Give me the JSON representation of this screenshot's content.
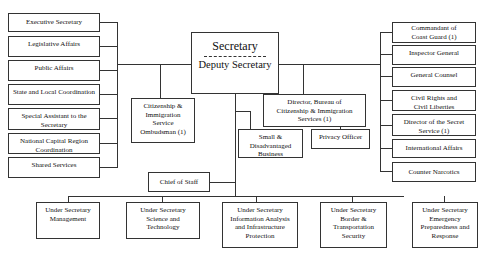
{
  "chart": {
    "center": {
      "top_label": "Secretary",
      "bottom_label": "Deputy Secretary"
    },
    "left_column": [
      {
        "label": "Executive Secretary"
      },
      {
        "label": "Legislative Affairs"
      },
      {
        "label": "Public Affairs"
      },
      {
        "label": "State and Local Coordination"
      },
      {
        "label": "Special Assistant to the Secretary"
      },
      {
        "label": "National Capital Region Coordination"
      },
      {
        "label": "Shared Services"
      }
    ],
    "right_column": [
      {
        "label": "Commandant of Coast Guard (1)"
      },
      {
        "label": "Inspector General"
      },
      {
        "label": "General Counsel"
      },
      {
        "label": "Civil Rights and Civil Liberties"
      },
      {
        "label": "Director of the Secret Service (1)"
      },
      {
        "label": "International Affairs"
      },
      {
        "label": "Counter Narcotics"
      }
    ],
    "middle": {
      "ombudsman": "Citizenship & Immigration Service Ombudsman (1)",
      "director_bureau": "Director, Bureau of Citizenship & Immigration Services (1)",
      "small_business": "Small & Disadvantaged Business",
      "privacy_officer": "Privacy Officer",
      "chief_of_staff": "Chief of Staff"
    },
    "under_secretaries": [
      {
        "label": "Under Secretary Management"
      },
      {
        "label": "Under Secretary Science and Technology"
      },
      {
        "label": "Under Secretary Information Analysis and Infrastructure Protection"
      },
      {
        "label": "Under Secretary Border & Transportation Security"
      },
      {
        "label": "Under Secretary Emergency Preparedness and Response"
      }
    ]
  }
}
